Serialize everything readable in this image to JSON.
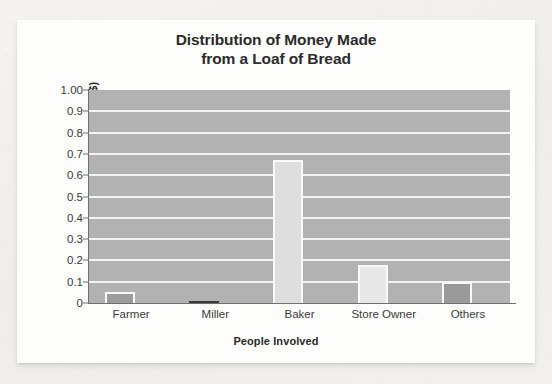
{
  "chart_data": {
    "type": "bar",
    "title": "Distribution of Money Made from a Loaf of Bread",
    "title_lines": [
      "Distribution of Money Made",
      "from a Loaf of Bread"
    ],
    "xlabel": "People Involved",
    "ylabel": "Money Received ($)",
    "categories": [
      "Farmer",
      "Miller",
      "Baker",
      "Store Owner",
      "Others"
    ],
    "values": [
      0.05,
      0.01,
      0.67,
      0.18,
      0.1
    ],
    "ylim": [
      0,
      1.0
    ],
    "ytick_values": [
      1.0,
      0.9,
      0.8,
      0.7,
      0.6,
      0.5,
      0.4,
      0.3,
      0.2,
      0.1,
      0
    ],
    "ytick_labels": [
      "1.00",
      "0.9",
      "0.8",
      "0.7",
      "0.6",
      "0.5",
      "0.4",
      "0.3",
      "0.2",
      "0.1",
      "0"
    ],
    "grid": true,
    "grid_color": "#f3f3f3",
    "legend": null,
    "plot_background": "#b2b2b2",
    "bar_colors": [
      "#9c9c9c",
      "#3a3a3a",
      "#dedede",
      "#e8e8e8",
      "#9a9a9a"
    ],
    "bar_border_color": "#fafafa",
    "page_background": "#f1f0ee",
    "card_background": "#fdfdfc",
    "text_color": "#2b2b2b"
  }
}
